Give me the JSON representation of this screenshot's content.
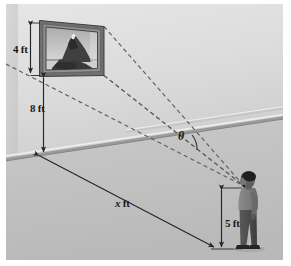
{
  "figure": {
    "type": "geometry-diagram",
    "background_color": "#cfcfcf",
    "wall_color": "#d9d9d9",
    "floor_color": "#c2c2c2",
    "line_color": "#333333",
    "dashed_color": "#6b6b6b"
  },
  "labels": {
    "painting_height": "4 ft",
    "wall_height_to_painting": "8 ft",
    "horizontal_distance": "x ft",
    "horizontal_distance_var": "x",
    "horizontal_distance_unit": " ft",
    "eye_height": "5 ft",
    "viewing_angle": "θ"
  },
  "elements": {
    "painting_frame": "framed picture of a mountain",
    "person": "standing viewer facing the painting",
    "sight_line_top": "dashed line from top of painting to viewer's eye",
    "sight_line_bottom": "dashed line from bottom of painting to viewer's eye",
    "ground_line": "solid measured line along the floor",
    "wall_floor_edge": "wall and floor junction"
  }
}
